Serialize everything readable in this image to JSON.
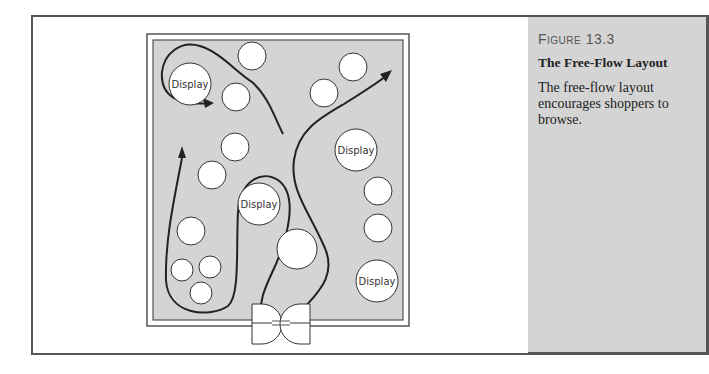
{
  "figure": {
    "number_prefix": "Figure",
    "number": "13.3",
    "title": "The Free-Flow Layout",
    "caption": "The free-flow layout encourages shoppers to browse."
  },
  "diagram": {
    "type": "store-floor-plan",
    "display_label": "Display",
    "displays": [
      {
        "x": 190,
        "y": 84,
        "r": 21,
        "label": "Display"
      },
      {
        "x": 252,
        "y": 56,
        "r": 14,
        "label": ""
      },
      {
        "x": 236,
        "y": 97,
        "r": 14,
        "label": ""
      },
      {
        "x": 324,
        "y": 93,
        "r": 14,
        "label": ""
      },
      {
        "x": 353,
        "y": 67,
        "r": 14,
        "label": ""
      },
      {
        "x": 235,
        "y": 147,
        "r": 14,
        "label": ""
      },
      {
        "x": 212,
        "y": 175,
        "r": 14,
        "label": ""
      },
      {
        "x": 356,
        "y": 150,
        "r": 21,
        "label": "Display"
      },
      {
        "x": 259,
        "y": 204,
        "r": 21,
        "label": "Display"
      },
      {
        "x": 378,
        "y": 191,
        "r": 14,
        "label": ""
      },
      {
        "x": 378,
        "y": 228,
        "r": 14,
        "label": ""
      },
      {
        "x": 191,
        "y": 231,
        "r": 14,
        "label": ""
      },
      {
        "x": 297,
        "y": 249,
        "r": 20,
        "label": ""
      },
      {
        "x": 182,
        "y": 270,
        "r": 11,
        "label": ""
      },
      {
        "x": 210,
        "y": 267,
        "r": 11,
        "label": ""
      },
      {
        "x": 201,
        "y": 293,
        "r": 11,
        "label": ""
      },
      {
        "x": 377,
        "y": 281,
        "r": 21,
        "label": "Display"
      }
    ],
    "colors": {
      "floor": "#d4d4d4",
      "path": "#222222",
      "display_fill": "#ffffff"
    }
  }
}
